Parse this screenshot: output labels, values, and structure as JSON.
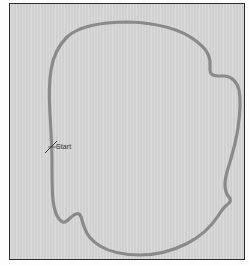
{
  "figure": {
    "kind": "race-track-outline-map",
    "background_color": "#d2d2d2",
    "frame_border_color": "#2b2b2b",
    "outer_page_color": "#fdfdfd"
  },
  "track": {
    "name": "",
    "line_color": "#8a8a8a",
    "line_width": 3.2,
    "closed": true,
    "path": "M 118 18 C 150 19 172 26 186 37 C 195 44 199 49 200 57 L 200 66 C 200 70 203 72 208 72 L 215 72 C 222 73 227 78 229 86 C 231 96 230 110 228 124 C 226 137 223 148 220 158 C 217 167 215 174 215 180 C 215 186 216 190 219 193 C 221 195 221 198 218 200 C 214 203 211 207 208 212 C 201 223 190 233 176 240 C 162 247 146 251 130 251 C 114 251 100 248 90 242 C 82 237 77 231 75 225 C 73 220 72 216 71 213 C 70 210 68 209 66 210 C 63 211 61 213 58 216 C 55 219 52 219 49 215 C 46 211 44 205 43 196 C 42 186 42 174 42 160 C 42 144 41 127 40 110 C 39 94 39 79 41 66 C 43 53 48 42 57 33 C 68 23 88 18 118 18 Z"
  },
  "start_marker": {
    "label": "Start",
    "tick_color": "#3a3a3a",
    "leader_color": "#3a3a3a",
    "position": {
      "x": 41,
      "y": 143
    },
    "tick_x1": 35,
    "tick_y1": 149,
    "tick_x2": 47,
    "tick_y2": 137,
    "leader_x1": 38,
    "leader_y1": 143,
    "leader_x2": 47,
    "leader_y2": 143
  }
}
